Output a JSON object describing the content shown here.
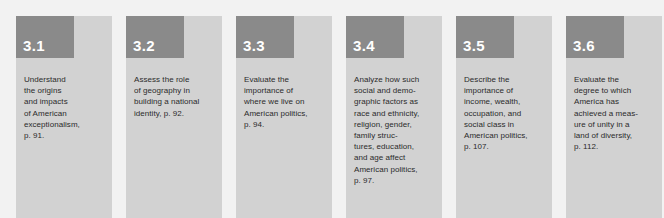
{
  "panel": {
    "name": "chapter-learning-objectives",
    "background_color": "#f2f2f2",
    "card_body_color": "#d2d2d2",
    "card_header_color": "#8a8a8a",
    "number_color": "#ffffff",
    "text_color": "#2b2b2b"
  },
  "objectives": [
    {
      "number": "3.1",
      "text": "Understand\nthe origins\nand impacts\nof American\nexceptionalism,\np. 91."
    },
    {
      "number": "3.2",
      "text": "Assess the role\nof geography in\nbuilding a national\nidentity, p. 92."
    },
    {
      "number": "3.3",
      "text": "Evaluate the\nimportance of\nwhere we live on\nAmerican politics,\np. 94."
    },
    {
      "number": "3.4",
      "text": "Analyze how such\nsocial and demo-\ngraphic factors as\nrace and ethnicity,\nreligion, gender,\nfamily struc-\ntures, education,\nand age affect\nAmerican politics,\np. 97."
    },
    {
      "number": "3.5",
      "text": "Describe the\nimportance of\nincome, wealth,\noccupation, and\nsocial class in\nAmerican politics,\np. 107."
    },
    {
      "number": "3.6",
      "text": "Evaluate the\ndegree to which\nAmerica has\nachieved a meas-\nure of unity in a\nland of diversity,\np. 112."
    }
  ]
}
